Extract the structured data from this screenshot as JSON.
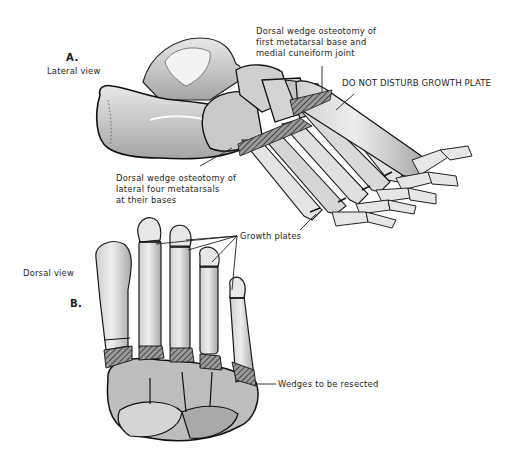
{
  "figure": {
    "panels": [
      {
        "id": "A",
        "letter": "A.",
        "view": "Lateral view",
        "annotations": [
          {
            "id": "first-met",
            "lines": [
              "Dorsal wedge osteotomy of",
              "first metatarsal base and",
              "medial cuneiform joint"
            ]
          },
          {
            "id": "growth-plate-warning",
            "lines": [
              "DO NOT DISTURB GROWTH PLATE"
            ]
          },
          {
            "id": "lateral-four",
            "lines": [
              "Dorsal wedge osteotomy of",
              "lateral four metatarsals",
              "at their bases"
            ]
          }
        ]
      },
      {
        "id": "B",
        "letter": "B.",
        "view": "Dorsal view",
        "annotations": [
          {
            "id": "growth-plates",
            "lines": [
              "Growth plates"
            ]
          },
          {
            "id": "wedges",
            "lines": [
              "Wedges to be resected"
            ]
          }
        ]
      }
    ],
    "colors": {
      "background": "#ffffff",
      "bone_light": "#e4e4e4",
      "bone_mid": "#bdbdbd",
      "bone_dark": "#8a8a8a",
      "outline": "#1a1a1a",
      "text": "#1e1e1e"
    }
  }
}
